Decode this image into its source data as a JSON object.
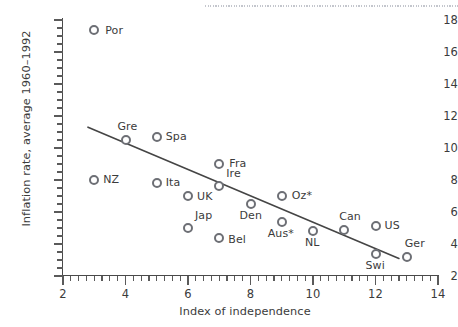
{
  "chart_data": {
    "type": "scatter",
    "title": "",
    "xlabel": "Index of independence",
    "ylabel": "Inflation rate, average 1960–1992",
    "xlim": [
      2,
      14
    ],
    "ylim": [
      2,
      18
    ],
    "x_ticks": [
      "2",
      "4",
      "6",
      "8",
      "10",
      "12",
      "14"
    ],
    "y_ticks": [
      "2",
      "4",
      "6",
      "8",
      "10",
      "12",
      "14",
      "16",
      "18"
    ],
    "x_tick_step": 2,
    "y_tick_step": 2,
    "x_minor_step": 0.25,
    "y_minor_step": 0.5,
    "grid": false,
    "legend": "none",
    "marker_style": "open-circle",
    "points": [
      {
        "label": "Por",
        "x": 3,
        "y": 17.4,
        "label_dx": 11,
        "label_dy": -6
      },
      {
        "label": "Gre",
        "x": 4,
        "y": 10.5,
        "label_dx": -8,
        "label_dy": -20
      },
      {
        "label": "Spa",
        "x": 5,
        "y": 10.7,
        "label_dx": 9,
        "label_dy": -7
      },
      {
        "label": "NZ",
        "x": 3,
        "y": 8.0,
        "label_dx": 9,
        "label_dy": -7
      },
      {
        "label": "Ita",
        "x": 5,
        "y": 7.8,
        "label_dx": 9,
        "label_dy": -7
      },
      {
        "label": "Fra",
        "x": 7,
        "y": 9.0,
        "label_dx": 10,
        "label_dy": -7
      },
      {
        "label": "Ire",
        "x": 7,
        "y": 7.6,
        "label_dx": 7,
        "label_dy": -19
      },
      {
        "label": "UK",
        "x": 6,
        "y": 7.0,
        "label_dx": 9,
        "label_dy": -6
      },
      {
        "label": "Oz*",
        "x": 9,
        "y": 7.0,
        "label_dx": 10,
        "label_dy": -7
      },
      {
        "label": "Den",
        "x": 8,
        "y": 6.5,
        "label_dx": -11,
        "label_dy": 5
      },
      {
        "label": "Jap",
        "x": 6,
        "y": 5.0,
        "label_dx": 7,
        "label_dy": -19
      },
      {
        "label": "Aus*",
        "x": 9,
        "y": 5.4,
        "label_dx": -14,
        "label_dy": 5
      },
      {
        "label": "Bel",
        "x": 7,
        "y": 4.4,
        "label_dx": 9,
        "label_dy": -5
      },
      {
        "label": "NL",
        "x": 10,
        "y": 4.8,
        "label_dx": -8,
        "label_dy": 5
      },
      {
        "label": "Can",
        "x": 11,
        "y": 4.9,
        "label_dx": -5,
        "label_dy": -20
      },
      {
        "label": "US",
        "x": 12,
        "y": 5.1,
        "label_dx": 9,
        "label_dy": -7
      },
      {
        "label": "Swi",
        "x": 12,
        "y": 3.4,
        "label_dx": -10,
        "label_dy": 5
      },
      {
        "label": "Ger",
        "x": 13,
        "y": 3.2,
        "label_dx": -2,
        "label_dy": -20
      }
    ],
    "trendline": {
      "type": "linear-fit",
      "x_start": 2.8,
      "y_start": 11.3,
      "x_end": 12.75,
      "y_end": 3.1,
      "color": "#454545"
    },
    "colors": {
      "marker_edge": "#6d6f75",
      "marker_fill": "#ffffff",
      "axis": "#4a4a4a",
      "text": "#3b3b3b",
      "trendline": "#454545"
    }
  }
}
